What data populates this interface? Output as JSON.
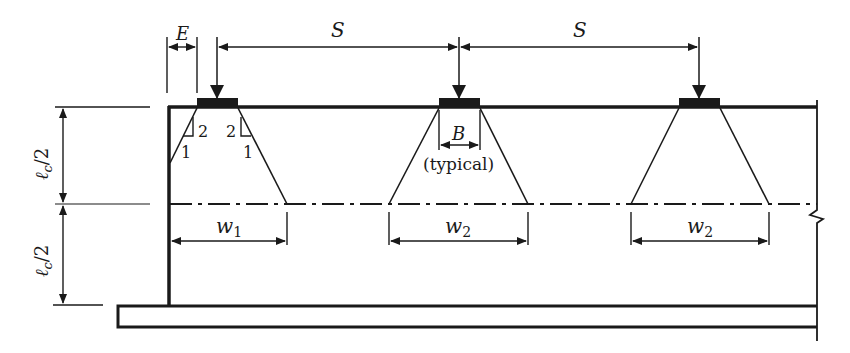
{
  "diagram": {
    "type": "structural-load-distribution",
    "colors": {
      "ink": "#1a1a1a",
      "background": "#ffffff"
    },
    "labels": {
      "edge_distance": "E",
      "spacing_1": "S",
      "spacing_2": "S",
      "bearing_width": "B",
      "typical_note": "(typical)",
      "half_height_upper_l": "ℓ",
      "half_height_upper_sub": "c",
      "half_height_upper_div": "/2",
      "half_height_lower_l": "ℓ",
      "half_height_lower_sub": "c",
      "half_height_lower_div": "/2",
      "slope_left_rise": "2",
      "slope_left_run": "1",
      "slope_right_rise": "2",
      "slope_right_run": "1",
      "width_1_w": "w",
      "width_1_sub": "1",
      "width_2a_w": "w",
      "width_2a_sub": "2",
      "width_2b_w": "w",
      "width_2b_sub": "2"
    },
    "elements": {
      "loads": [
        "load-1",
        "load-2",
        "load-3"
      ],
      "bearing_pads": 3,
      "slope_ratio": "2:1"
    }
  }
}
